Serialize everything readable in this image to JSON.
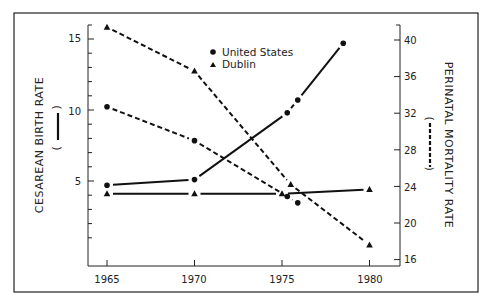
{
  "chart_data": {
    "type": "line",
    "title": "",
    "xlabel": "",
    "ylabel": "CESAREAN BIRTH RATE",
    "ylabel_marker": "( —— )",
    "y2label": "PERINATAL MORTALITY RATE",
    "y2label_marker": "( - - - )",
    "x_ticks": [
      1965,
      1970,
      1975,
      1980
    ],
    "ylim": [
      0,
      16
    ],
    "y_ticks": [
      5,
      10,
      15
    ],
    "y2lim": [
      15,
      41.5
    ],
    "y2_ticks": [
      16,
      20,
      24,
      28,
      32,
      36,
      40
    ],
    "grid": false,
    "legend": {
      "position": "upper center",
      "entries": [
        {
          "label": "United States",
          "marker": "circle"
        },
        {
          "label": "Dublin",
          "marker": "triangle"
        }
      ]
    },
    "series": [
      {
        "name": "United States - Cesarean birth rate",
        "axis": "left",
        "style": "solid",
        "marker": "circle",
        "x": [
          1965,
          1970,
          1975.3,
          1975.9,
          1978.5
        ],
        "values": [
          4.7,
          5.1,
          9.8,
          10.7,
          14.7
        ]
      },
      {
        "name": "United States - Perinatal mortality rate",
        "axis": "right",
        "style": "dashed",
        "marker": "circle",
        "x": [
          1965,
          1970,
          1975.3,
          1975.9
        ],
        "values": [
          32.7,
          29.0,
          22.9,
          22.2
        ]
      },
      {
        "name": "Dublin - Cesarean birth rate",
        "axis": "left",
        "style": "solid",
        "marker": "triangle",
        "x": [
          1965,
          1970,
          1975,
          1980
        ],
        "values": [
          4.1,
          4.1,
          4.1,
          4.4
        ]
      },
      {
        "name": "Dublin - Perinatal mortality rate",
        "axis": "right",
        "style": "dashed",
        "marker": "triangle",
        "x": [
          1965,
          1970,
          1975.5,
          1980
        ],
        "values": [
          41.4,
          36.6,
          24.2,
          17.6
        ]
      }
    ]
  },
  "labels": {
    "left_axis_title": "CESAREAN BIRTH RATE",
    "right_axis_title": "PERINATAL MORTALITY RATE",
    "legend_us": "United States",
    "legend_dublin": "Dublin",
    "x_tick_1965": "1965",
    "x_tick_1970": "1970",
    "x_tick_1975": "1975",
    "x_tick_1980": "1980",
    "y_tick_5": "5",
    "y_tick_10": "10",
    "y_tick_15": "15",
    "y2_tick_16": "16",
    "y2_tick_20": "20",
    "y2_tick_24": "24",
    "y2_tick_28": "28",
    "y2_tick_32": "32",
    "y2_tick_36": "36",
    "y2_tick_40": "40",
    "paren_open": "(",
    "paren_close": ")"
  }
}
